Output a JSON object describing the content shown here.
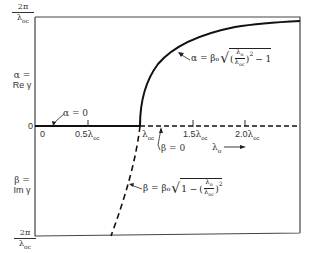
{
  "diagram": {
    "type": "propagation-constant-vs-wavelength",
    "y_axis": {
      "top_label": {
        "numerator": "2π",
        "denominator": "λ",
        "denominator_sub": "oc"
      },
      "bottom_label": {
        "numerator": "2π",
        "denominator": "λ",
        "denominator_sub": "oc"
      },
      "upper_label_line1": "α =",
      "upper_label_line2": "Re γ",
      "lower_label_line1": "β =",
      "lower_label_line2": "Im γ",
      "zero_label": "0"
    },
    "x_axis": {
      "origin_label": "0",
      "ticks": [
        {
          "value": "0.5",
          "unit": "λ",
          "unit_sub": "oc"
        },
        {
          "value": "",
          "unit": "λ",
          "unit_sub": "oc"
        },
        {
          "value": "1.5",
          "unit": "λ",
          "unit_sub": "oc"
        },
        {
          "value": "2.0",
          "unit": "λ",
          "unit_sub": "oc"
        }
      ],
      "variable": "λ",
      "variable_sub": "o",
      "arrow": "→"
    },
    "annotations": {
      "alpha_zero": "α = 0",
      "beta_zero": "β = 0",
      "alpha_curve": {
        "lhs": "α = β",
        "lhs_sub": "o",
        "inner_num": "λ",
        "inner_num_sub": "o",
        "inner_den": "λ",
        "inner_den_sub": "oc",
        "exponent": "2",
        "tail": "− 1"
      },
      "beta_curve": {
        "lhs": "β = β",
        "lhs_sub": "o",
        "head": "1 −",
        "inner_num": "λ",
        "inner_num_sub": "o",
        "inner_den": "λ",
        "inner_den_sub": "oc",
        "exponent": "2"
      }
    },
    "colors": {
      "line": "#1a1a1a",
      "frame": "#333333",
      "background": "#ffffff"
    }
  }
}
